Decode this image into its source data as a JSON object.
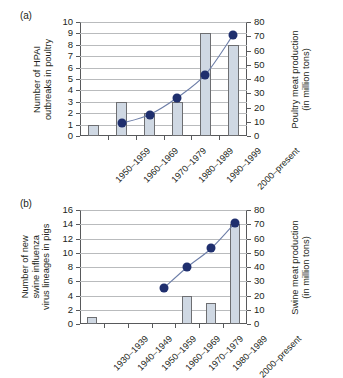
{
  "figure": {
    "panels": [
      {
        "key": "a",
        "label": "(a)",
        "chart_data": {
          "type": "bar",
          "title": "",
          "categories": [
            "1950–1959",
            "1960–1969",
            "1970–1979",
            "1980–1989",
            "1990–1999",
            "2000–present"
          ],
          "series": [
            {
              "name": "Number of HPAI outbreaks in poultry",
              "type": "bar",
              "axis": "left",
              "values": [
                1,
                3,
                2,
                3,
                9,
                8
              ]
            },
            {
              "name": "Poultry meat production (in million tons)",
              "type": "line",
              "axis": "right",
              "values": [
                null,
                9,
                15,
                27,
                43,
                71
              ]
            }
          ],
          "xlabel": "",
          "ylabel": "Number of HPAI outbreaks in poultry",
          "y2label": "Poultry meat production (in million tons)",
          "ylim": [
            0,
            10
          ],
          "y2lim": [
            0,
            80
          ],
          "yticks": [
            0,
            1,
            2,
            3,
            4,
            5,
            6,
            7,
            8,
            9,
            10
          ],
          "y2ticks": [
            0,
            10,
            20,
            30,
            40,
            50,
            60,
            70,
            80
          ],
          "grid": true,
          "legend": "none"
        },
        "axis_left_title": [
          "Number of HPAI",
          "outbreaks in poultry"
        ],
        "axis_right_title": [
          "Poultry meat production",
          "(in million tons)"
        ]
      },
      {
        "key": "b",
        "label": "(b)",
        "chart_data": {
          "type": "bar",
          "title": "",
          "categories": [
            "1930–1939",
            "1940–1949",
            "1950–1959",
            "1960–1969",
            "1970–1979",
            "1980–1989",
            "2000–present"
          ],
          "series": [
            {
              "name": "Number of new swine influenza virus lineages in pigs",
              "type": "bar",
              "axis": "left",
              "values": [
                1,
                0,
                0,
                0,
                4,
                3,
                14
              ]
            },
            {
              "name": "Swine meat production (in million tons)",
              "type": "line",
              "axis": "right",
              "values": [
                null,
                null,
                null,
                25,
                40,
                53,
                71
              ]
            }
          ],
          "xlabel": "",
          "ylabel": "Number of new swine influenza virus lineages in pigs",
          "y2label": "Swine meat production (in million tons)",
          "ylim": [
            0,
            16
          ],
          "y2lim": [
            0,
            80
          ],
          "yticks": [
            0,
            2,
            4,
            6,
            8,
            10,
            12,
            14,
            16
          ],
          "y2ticks": [
            0,
            10,
            20,
            30,
            40,
            50,
            60,
            70,
            80
          ],
          "grid": true,
          "legend": "none"
        },
        "axis_left_title": [
          "Number of new",
          "swine influenza",
          "virus lineages in pigs"
        ],
        "axis_right_title": [
          "Swine meat production",
          "(in million tons)"
        ]
      }
    ],
    "colors": {
      "bar_fill": "#cfd8e3",
      "bar_stroke": "#6d6e71",
      "marker": "#1f2f6e",
      "line": "#6d7ea8",
      "grid": "#b9bbbd",
      "axis": "#58595b",
      "text": "#231f20",
      "background": "#ffffff"
    }
  }
}
